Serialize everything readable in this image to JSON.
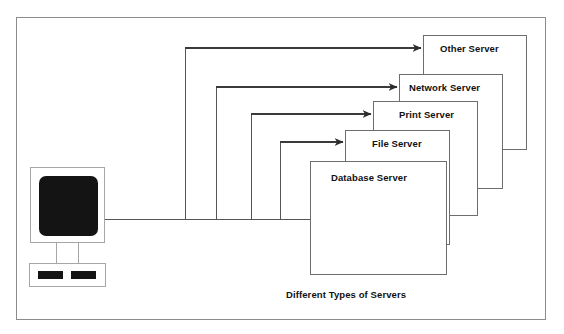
{
  "diagram": {
    "caption": "Different Types of Servers",
    "client": {
      "device_name": "desktop-computer",
      "monitor_screen_color": "#141414",
      "outline_color": "#a6a6a6"
    },
    "style": {
      "frame_border_color": "#8c8c8c",
      "box_border_color": "#6e6e6e",
      "line_color": "#555555",
      "background": "#ffffff",
      "text_color": "#111111"
    },
    "servers": [
      {
        "id": "other-server",
        "label": "Other Server",
        "x": 423,
        "y": 35,
        "width": 104,
        "height": 115,
        "label_x": 440,
        "label_y": 43,
        "arrow": {
          "tip_x": 423,
          "tip_y": 48,
          "riser_x": 185,
          "trunk_y": 219
        }
      },
      {
        "id": "network-server",
        "label": "Network Server",
        "x": 399,
        "y": 74,
        "width": 104,
        "height": 115,
        "label_x": 409,
        "label_y": 82,
        "arrow": {
          "tip_x": 399,
          "tip_y": 87,
          "riser_x": 216,
          "trunk_y": 219
        }
      },
      {
        "id": "print-server",
        "label": "Print Server",
        "x": 373,
        "y": 101,
        "width": 105,
        "height": 115,
        "label_x": 399,
        "label_y": 109,
        "arrow": {
          "tip_x": 373,
          "tip_y": 114,
          "riser_x": 251,
          "trunk_y": 219
        }
      },
      {
        "id": "file-server",
        "label": "File Server",
        "x": 345,
        "y": 130,
        "width": 105,
        "height": 115,
        "label_x": 372,
        "label_y": 138,
        "arrow": {
          "tip_x": 345,
          "tip_y": 142,
          "riser_x": 280,
          "trunk_y": 219
        }
      },
      {
        "id": "database-server",
        "label": "Database Server",
        "x": 310,
        "y": 161,
        "width": 137,
        "height": 114,
        "label_x": 331,
        "label_y": 172,
        "arrow": {
          "tip_x": 310,
          "tip_y": 219,
          "riser_x": 310,
          "trunk_y": 219
        }
      }
    ],
    "trunk": {
      "start_x": 105,
      "end_x": 310,
      "y": 219
    }
  }
}
